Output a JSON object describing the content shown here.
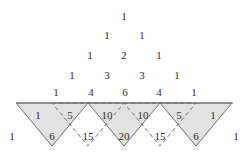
{
  "figure": {
    "colors": {
      "text": "#2b2b2b",
      "shade_fill": "#e2e2e2",
      "solid_stroke": "#6e6e6e",
      "dashed_stroke": "#6e6e6e",
      "background": "#ffffff"
    }
  },
  "pascal": {
    "rows": [
      {
        "index": 0,
        "values": [
          "1"
        ]
      },
      {
        "index": 1,
        "values": [
          "1",
          "1"
        ]
      },
      {
        "index": 2,
        "values": [
          "1",
          "2",
          "1"
        ]
      },
      {
        "index": 3,
        "values": [
          "1",
          "3",
          "3",
          "1"
        ]
      },
      {
        "index": 4,
        "values": [
          "1",
          "4",
          "6",
          "4",
          "1"
        ]
      },
      {
        "index": 5,
        "values": [
          "1",
          "5",
          "10",
          "10",
          "5",
          "1"
        ]
      },
      {
        "index": 6,
        "values": [
          "1",
          "6",
          "15",
          "20",
          "15",
          "6",
          "1"
        ]
      }
    ]
  },
  "labels": {
    "row0": {
      "c0": "1"
    },
    "row1": {
      "c0": "1",
      "c1": "1"
    },
    "row2": {
      "c0": "1",
      "c1": "2",
      "c2": "1"
    },
    "row3": {
      "c0": "1",
      "c1": "3",
      "c2": "3",
      "c3": "1"
    },
    "row4": {
      "c0": "1",
      "c1": "4",
      "c2": "6",
      "c3": "4",
      "c4": "1"
    },
    "row5": {
      "c0": "1",
      "c1": "5",
      "c2": "10",
      "c3": "10",
      "c4": "5",
      "c5": "1"
    },
    "row6": {
      "c0": "1",
      "c1": "6",
      "c2": "15",
      "c3": "20",
      "c4": "15",
      "c5": "6",
      "c6": "1"
    }
  },
  "shapes": {
    "baseline_y": 103,
    "apex_y": 146,
    "left_x": 16,
    "right_x": 233,
    "cell_width": 36,
    "shaded_count": 4,
    "dashed_count": 3
  }
}
